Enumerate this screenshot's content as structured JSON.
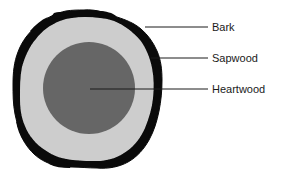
{
  "diagram": {
    "background_color": "#ffffff",
    "regions": {
      "bark": {
        "label": "Bark",
        "color": "#000000",
        "description": "outer irregular black ring"
      },
      "sapwood": {
        "label": "Sapwood",
        "color": "#cdcdcd",
        "description": "light gray ring between bark and heartwood"
      },
      "heartwood": {
        "label": "Heartwood",
        "color": "#666666",
        "description": "dark gray inner core circle"
      }
    },
    "leader_lines": {
      "color": "#000000",
      "bark": {
        "x1": 145,
        "y1": 27,
        "x2": 208,
        "y2": 27
      },
      "sapwood": {
        "x1": 151,
        "y1": 58,
        "x2": 208,
        "y2": 58
      },
      "heartwood": {
        "x1": 90,
        "y1": 89,
        "x2": 208,
        "y2": 89
      }
    },
    "geometry": {
      "heartwood_center_x": 89,
      "heartwood_center_y": 88,
      "heartwood_radius": 46,
      "trunk_bounds": {
        "left": 13,
        "top": 10,
        "right": 162,
        "bottom": 168
      }
    }
  }
}
